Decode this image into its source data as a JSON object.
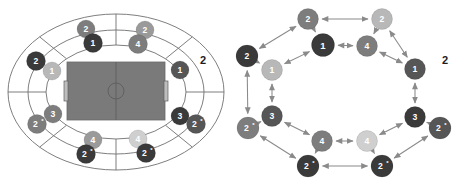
{
  "figure": {
    "title": "",
    "panels": [
      "stadium-seating-layout",
      "ring-graph-topology"
    ],
    "palette": {
      "dark": "#3a3a3a",
      "mid_dark": "#565656",
      "mid": "#7d7d7d",
      "mid_light": "#9a9a9a",
      "light": "#b8b8b8",
      "lighter": "#cfcfcf",
      "pitch": "#7a7a7a",
      "line": "#6f6f6f",
      "arrow": "#8a8a8a",
      "text_light": "#ffffff",
      "text_dark": "#1d1d1d"
    }
  },
  "chart_data": {
    "type": "diagram",
    "title": "",
    "xlabel": "",
    "ylabel": "",
    "legend": [],
    "stadium": {
      "pitch": {
        "fill": "#7a7a7a",
        "features": [
          "center-line",
          "center-circle",
          "left-goal",
          "right-goal"
        ]
      },
      "rings": 3,
      "nodes": [
        {
          "id": "s1",
          "label": "2",
          "star": false,
          "shade": "mid",
          "fill": "#7d7d7d",
          "text": "#ffffff",
          "cx": 86,
          "cy": 29,
          "r": 9,
          "ring": "outer",
          "sector": "top-left"
        },
        {
          "id": "s2",
          "label": "1",
          "star": false,
          "shade": "dark",
          "fill": "#3a3a3a",
          "text": "#ffffff",
          "cx": 93,
          "cy": 43,
          "r": 9.5,
          "ring": "middle",
          "sector": "top-left"
        },
        {
          "id": "s3",
          "label": "2",
          "star": false,
          "shade": "mid_light",
          "fill": "#9a9a9a",
          "text": "#ffffff",
          "cx": 145,
          "cy": 30,
          "r": 9,
          "ring": "outer",
          "sector": "top-right"
        },
        {
          "id": "s4",
          "label": "4",
          "star": false,
          "shade": "mid",
          "fill": "#7d7d7d",
          "text": "#ffffff",
          "cx": 138,
          "cy": 44,
          "r": 9.5,
          "ring": "middle",
          "sector": "top-right"
        },
        {
          "id": "s5",
          "label": "2",
          "star": false,
          "shade": "dark",
          "fill": "#3a3a3a",
          "text": "#ffffff",
          "cx": 36,
          "cy": 61,
          "r": 9.5,
          "ring": "outer",
          "sector": "left"
        },
        {
          "id": "s6",
          "label": "1",
          "star": false,
          "shade": "light",
          "fill": "#b8b8b8",
          "text": "#ffffff",
          "cx": 52,
          "cy": 71,
          "r": 9,
          "ring": "middle",
          "sector": "left"
        },
        {
          "id": "s7",
          "label": "1",
          "star": false,
          "shade": "mid_dark",
          "fill": "#565656",
          "text": "#ffffff",
          "cx": 180,
          "cy": 70,
          "r": 9,
          "ring": "middle",
          "sector": "right"
        },
        {
          "id": "s8",
          "label": "3",
          "star": false,
          "shade": "mid",
          "fill": "#7d7d7d",
          "text": "#ffffff",
          "cx": 53,
          "cy": 114,
          "r": 9,
          "ring": "middle",
          "sector": "bottom-left"
        },
        {
          "id": "s9",
          "label": "2",
          "star": true,
          "shade": "mid",
          "fill": "#7d7d7d",
          "text": "#ffffff",
          "cx": 37,
          "cy": 124,
          "r": 9.5,
          "ring": "outer",
          "sector": "bottom-left"
        },
        {
          "id": "s10",
          "label": "3",
          "star": false,
          "shade": "dark",
          "fill": "#3a3a3a",
          "text": "#ffffff",
          "cx": 180,
          "cy": 116,
          "r": 9,
          "ring": "middle",
          "sector": "bottom-right"
        },
        {
          "id": "s11",
          "label": "2",
          "star": true,
          "shade": "mid_dark",
          "fill": "#565656",
          "text": "#ffffff",
          "cx": 196,
          "cy": 124,
          "r": 9.5,
          "ring": "outer",
          "sector": "bottom-right"
        },
        {
          "id": "s12",
          "label": "4",
          "star": false,
          "shade": "mid_light",
          "fill": "#9a9a9a",
          "text": "#ffffff",
          "cx": 93,
          "cy": 140,
          "r": 9,
          "ring": "middle",
          "sector": "bottom-left"
        },
        {
          "id": "s13",
          "label": "2",
          "star": true,
          "shade": "dark",
          "fill": "#3a3a3a",
          "text": "#ffffff",
          "cx": 86,
          "cy": 154,
          "r": 9.5,
          "ring": "outer",
          "sector": "bottom-left"
        },
        {
          "id": "s14",
          "label": "4",
          "star": false,
          "shade": "lighter",
          "fill": "#cfcfcf",
          "text": "#ffffff",
          "cx": 138,
          "cy": 139,
          "r": 9,
          "ring": "middle",
          "sector": "bottom-right"
        },
        {
          "id": "s15",
          "label": "2",
          "star": true,
          "shade": "dark",
          "fill": "#3a3a3a",
          "text": "#ffffff",
          "cx": 146,
          "cy": 153,
          "r": 9.5,
          "ring": "outer",
          "sector": "bottom-right"
        }
      ],
      "free_labels": [
        {
          "id": "sl1",
          "text": "2",
          "x": 203,
          "y": 60
        }
      ]
    },
    "graph": {
      "nodes": [
        {
          "id": "g1",
          "label": "2",
          "star": false,
          "shade": "mid",
          "fill": "#7d7d7d",
          "text": "#ffffff",
          "cx": 76,
          "cy": 19,
          "r": 10.5
        },
        {
          "id": "g2",
          "label": "2",
          "star": false,
          "shade": "light",
          "fill": "#b8b8b8",
          "text": "#ffffff",
          "cx": 150,
          "cy": 19,
          "r": 10.5
        },
        {
          "id": "g3",
          "label": "1",
          "star": false,
          "shade": "dark",
          "fill": "#3a3a3a",
          "text": "#ffffff",
          "cx": 91,
          "cy": 45,
          "r": 11.5
        },
        {
          "id": "g4",
          "label": "4",
          "star": false,
          "shade": "mid",
          "fill": "#7d7d7d",
          "text": "#ffffff",
          "cx": 135,
          "cy": 46,
          "r": 10.5
        },
        {
          "id": "g5",
          "label": "2",
          "star": false,
          "shade": "dark",
          "fill": "#3a3a3a",
          "text": "#ffffff",
          "cx": 15,
          "cy": 56,
          "r": 11
        },
        {
          "id": "g6",
          "label": "1",
          "star": false,
          "shade": "light",
          "fill": "#b8b8b8",
          "text": "#ffffff",
          "cx": 40,
          "cy": 70,
          "r": 10.5
        },
        {
          "id": "g7",
          "label": "1",
          "star": false,
          "shade": "mid_dark",
          "fill": "#565656",
          "text": "#ffffff",
          "cx": 183,
          "cy": 69,
          "r": 10.5
        },
        {
          "id": "g8",
          "label": "3",
          "star": false,
          "shade": "mid_dark",
          "fill": "#565656",
          "text": "#ffffff",
          "cx": 40,
          "cy": 116,
          "r": 10.5
        },
        {
          "id": "g9",
          "label": "2",
          "star": true,
          "shade": "mid",
          "fill": "#7d7d7d",
          "text": "#ffffff",
          "cx": 16,
          "cy": 128,
          "r": 11
        },
        {
          "id": "g10",
          "label": "3",
          "star": false,
          "shade": "dark",
          "fill": "#3a3a3a",
          "text": "#ffffff",
          "cx": 183,
          "cy": 117,
          "r": 10.5
        },
        {
          "id": "g11",
          "label": "2",
          "star": true,
          "shade": "mid_dark",
          "fill": "#565656",
          "text": "#ffffff",
          "cx": 208,
          "cy": 128,
          "r": 11
        },
        {
          "id": "g12",
          "label": "4",
          "star": false,
          "shade": "mid",
          "fill": "#7d7d7d",
          "text": "#ffffff",
          "cx": 90,
          "cy": 141,
          "r": 10.5
        },
        {
          "id": "g13",
          "label": "4",
          "star": false,
          "shade": "lighter",
          "fill": "#cfcfcf",
          "text": "#ffffff",
          "cx": 135,
          "cy": 141,
          "r": 10.5
        },
        {
          "id": "g14",
          "label": "2",
          "star": true,
          "shade": "dark",
          "fill": "#3a3a3a",
          "text": "#ffffff",
          "cx": 76,
          "cy": 166,
          "r": 11
        },
        {
          "id": "g15",
          "label": "2",
          "star": true,
          "shade": "dark",
          "fill": "#3a3a3a",
          "text": "#ffffff",
          "cx": 150,
          "cy": 166,
          "r": 11
        }
      ],
      "free_labels": [
        {
          "id": "gl1",
          "text": "2",
          "x": 213,
          "y": 60
        }
      ],
      "edges": [
        {
          "from": "g1",
          "to": "g2",
          "arrow": "both"
        },
        {
          "from": "g1",
          "to": "g3",
          "arrow": "to"
        },
        {
          "from": "g2",
          "to": "g4",
          "arrow": "to"
        },
        {
          "from": "g3",
          "to": "g4",
          "arrow": "both"
        },
        {
          "from": "g3",
          "to": "g6",
          "arrow": "both"
        },
        {
          "from": "g4",
          "to": "g7",
          "arrow": "both"
        },
        {
          "from": "g5",
          "to": "g6",
          "arrow": "to"
        },
        {
          "from": "g5",
          "to": "g1",
          "arrow": "both"
        },
        {
          "from": "g2",
          "to": "g7",
          "arrow": "both"
        },
        {
          "from": "g6",
          "to": "g8",
          "arrow": "both"
        },
        {
          "from": "g7",
          "to": "g10",
          "arrow": "both"
        },
        {
          "from": "g5",
          "to": "g9",
          "arrow": "both"
        },
        {
          "from": "g8",
          "to": "g9",
          "arrow": "to"
        },
        {
          "from": "g10",
          "to": "g11",
          "arrow": "to"
        },
        {
          "from": "g8",
          "to": "g12",
          "arrow": "both"
        },
        {
          "from": "g10",
          "to": "g13",
          "arrow": "both"
        },
        {
          "from": "g12",
          "to": "g13",
          "arrow": "both"
        },
        {
          "from": "g12",
          "to": "g14",
          "arrow": "to"
        },
        {
          "from": "g13",
          "to": "g15",
          "arrow": "to"
        },
        {
          "from": "g14",
          "to": "g15",
          "arrow": "both"
        },
        {
          "from": "g9",
          "to": "g14",
          "arrow": "both"
        },
        {
          "from": "g11",
          "to": "g15",
          "arrow": "both"
        }
      ]
    }
  }
}
